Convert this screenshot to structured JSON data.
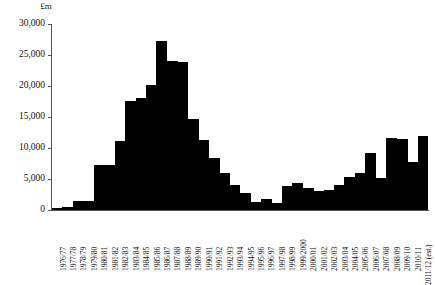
{
  "axes": {
    "y_unit_label": "£m",
    "y_ticks": [
      "30,000",
      "25,000",
      "20,000",
      "15,000",
      "10,000",
      "5,000",
      "0"
    ],
    "y_tick_values": [
      30000,
      25000,
      20000,
      15000,
      10000,
      5000,
      0
    ]
  },
  "chart_data": {
    "type": "bar",
    "title": "",
    "subtitle": "",
    "xlabel": "",
    "ylabel": "£m",
    "ylim": [
      0,
      30000
    ],
    "ytick_step": 5000,
    "grid": false,
    "legend": "none",
    "bar_color": "#000000",
    "categories": [
      "1976/77",
      "1977/78",
      "1978/79",
      "1979/80",
      "1980/81",
      "1981/82",
      "1982/83",
      "1983/84",
      "1984/85",
      "1985/86",
      "1986/87",
      "1987/88",
      "1988/89",
      "1989/90",
      "1990/91",
      "1991/92",
      "1992/93",
      "1993/94",
      "1994/95",
      "1995/96",
      "1996/97",
      "1997/98",
      "1998/99",
      "1999/2000",
      "2000/01",
      "2001/02",
      "2002/03",
      "2003/04",
      "2004/05",
      "2005/06",
      "2006/07",
      "2007/08",
      "2008/09",
      "2009/10",
      "2010/11",
      "2011/12 (est.)"
    ],
    "values": [
      300,
      500,
      1400,
      1400,
      7200,
      7300,
      11200,
      17600,
      18100,
      20200,
      27200,
      24000,
      23800,
      14600,
      11300,
      8400,
      6000,
      4100,
      2700,
      1300,
      1700,
      1200,
      3800,
      4300,
      3600,
      3100,
      3200,
      4000,
      5400,
      6000,
      9200,
      5200,
      11600,
      11500,
      7700,
      11900
    ],
    "annotations": []
  }
}
